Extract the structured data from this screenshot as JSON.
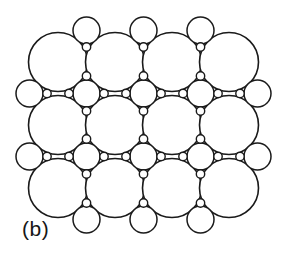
{
  "figure": {
    "panel_label": "(b)",
    "caption_alt": "Two-dimensional circle packing arrangement",
    "background_color": "#ffffff",
    "stroke_color": "#1a1a1a",
    "fill_color": "#ffffff",
    "width": 289,
    "height": 264
  },
  "chart_data": {
    "type": "scatter",
    "title": "(b)",
    "subtitle": "",
    "xlabel": "",
    "ylabel": "",
    "xlim": [
      0,
      289
    ],
    "ylim": [
      0,
      264
    ],
    "grid": false,
    "legend_position": "none",
    "annotations": [
      {
        "text": "(b)",
        "x": 22,
        "y": 234
      }
    ],
    "radii": {
      "large": 29.5,
      "medium": 13.5,
      "small": 4.2
    },
    "lattice": {
      "columns_x": [
        58,
        115,
        172,
        229
      ],
      "rows_y": [
        62,
        125,
        188
      ],
      "column_spacing": 57,
      "row_spacing": 63,
      "interstitial_x": [
        86.5,
        143.5,
        200.5
      ],
      "interstitial_y": [
        93.5,
        156.5
      ]
    },
    "series": [
      {
        "name": "large-circles",
        "radius": 29.5,
        "values": [
          {
            "x": 58,
            "y": 62
          },
          {
            "x": 115,
            "y": 62
          },
          {
            "x": 172,
            "y": 62
          },
          {
            "x": 229,
            "y": 62
          },
          {
            "x": 58,
            "y": 125
          },
          {
            "x": 115,
            "y": 125
          },
          {
            "x": 172,
            "y": 125
          },
          {
            "x": 229,
            "y": 125
          },
          {
            "x": 58,
            "y": 188
          },
          {
            "x": 115,
            "y": 188
          },
          {
            "x": 172,
            "y": 188
          },
          {
            "x": 229,
            "y": 188
          }
        ]
      },
      {
        "name": "medium-circles-interstitial",
        "radius": 13.5,
        "values": [
          {
            "x": 86.5,
            "y": 93.5
          },
          {
            "x": 143.5,
            "y": 93.5
          },
          {
            "x": 200.5,
            "y": 93.5
          },
          {
            "x": 86.5,
            "y": 156.5
          },
          {
            "x": 143.5,
            "y": 156.5
          },
          {
            "x": 200.5,
            "y": 156.5
          }
        ]
      },
      {
        "name": "medium-circles-edge-top",
        "radius": 13.5,
        "values": [
          {
            "x": 86.5,
            "y": 30.5
          },
          {
            "x": 143.5,
            "y": 30.5
          },
          {
            "x": 200.5,
            "y": 30.5
          }
        ]
      },
      {
        "name": "medium-circles-edge-bottom",
        "radius": 13.5,
        "values": [
          {
            "x": 86.5,
            "y": 219.5
          },
          {
            "x": 143.5,
            "y": 219.5
          },
          {
            "x": 200.5,
            "y": 219.5
          }
        ]
      },
      {
        "name": "medium-circles-edge-left",
        "radius": 13.5,
        "values": [
          {
            "x": 29.5,
            "y": 93.5
          },
          {
            "x": 29.5,
            "y": 156.5
          }
        ]
      },
      {
        "name": "medium-circles-edge-right",
        "radius": 13.5,
        "values": [
          {
            "x": 257.5,
            "y": 93.5
          },
          {
            "x": 257.5,
            "y": 156.5
          }
        ]
      },
      {
        "name": "small-circles",
        "radius": 4.2,
        "values": [
          {
            "x": 86.5,
            "y": 76.0
          },
          {
            "x": 86.5,
            "y": 111.0
          },
          {
            "x": 69.0,
            "y": 93.5
          },
          {
            "x": 104.0,
            "y": 93.5
          },
          {
            "x": 143.5,
            "y": 76.0
          },
          {
            "x": 143.5,
            "y": 111.0
          },
          {
            "x": 126.0,
            "y": 93.5
          },
          {
            "x": 161.0,
            "y": 93.5
          },
          {
            "x": 200.5,
            "y": 76.0
          },
          {
            "x": 200.5,
            "y": 111.0
          },
          {
            "x": 183.0,
            "y": 93.5
          },
          {
            "x": 218.0,
            "y": 93.5
          },
          {
            "x": 86.5,
            "y": 139.0
          },
          {
            "x": 86.5,
            "y": 174.0
          },
          {
            "x": 69.0,
            "y": 156.5
          },
          {
            "x": 104.0,
            "y": 156.5
          },
          {
            "x": 143.5,
            "y": 139.0
          },
          {
            "x": 143.5,
            "y": 174.0
          },
          {
            "x": 126.0,
            "y": 156.5
          },
          {
            "x": 161.0,
            "y": 156.5
          },
          {
            "x": 200.5,
            "y": 139.0
          },
          {
            "x": 200.5,
            "y": 174.0
          },
          {
            "x": 183.0,
            "y": 156.5
          },
          {
            "x": 218.0,
            "y": 156.5
          },
          {
            "x": 86.5,
            "y": 47.0
          },
          {
            "x": 143.5,
            "y": 47.0
          },
          {
            "x": 200.5,
            "y": 47.0
          },
          {
            "x": 86.5,
            "y": 203.0
          },
          {
            "x": 143.5,
            "y": 203.0
          },
          {
            "x": 200.5,
            "y": 203.0
          },
          {
            "x": 47.0,
            "y": 93.5
          },
          {
            "x": 47.0,
            "y": 156.5
          },
          {
            "x": 240.0,
            "y": 93.5
          },
          {
            "x": 240.0,
            "y": 156.5
          }
        ]
      }
    ]
  }
}
